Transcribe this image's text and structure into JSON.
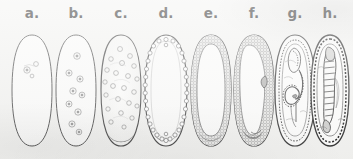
{
  "figure": {
    "background_color": "#f3f3f1",
    "ink_color": "#3a3a3a",
    "width": 353,
    "height": 159,
    "panel_count": 8
  },
  "panels": [
    {
      "label": "a.",
      "name": "panel-a",
      "stage": "fertilized egg / zygote",
      "x": 8,
      "width": 48,
      "nuclei_count": 3,
      "nuclei_layout": "few central nuclei near anterior",
      "has_pole_cells": false,
      "has_cell_layer": false,
      "has_furrow": false,
      "has_germ_band": false,
      "has_segments": false
    },
    {
      "label": "b.",
      "name": "panel-b",
      "stage": "early cleavage divisions",
      "x": 52,
      "width": 48,
      "nuclei_count": 9,
      "nuclei_layout": "scattered cleavage nuclei through yolk",
      "has_pole_cells": false,
      "has_cell_layer": false,
      "has_furrow": false,
      "has_germ_band": false,
      "has_segments": false
    },
    {
      "label": "c.",
      "name": "panel-c",
      "stage": "syncytial cleavage, nuclei migrating outward",
      "x": 96,
      "width": 50,
      "nuclei_count": 22,
      "nuclei_layout": "many nuclei spreading toward periphery",
      "has_pole_cells": true,
      "has_cell_layer": false,
      "has_furrow": false,
      "has_germ_band": false,
      "has_segments": false
    },
    {
      "label": "d.",
      "name": "panel-d",
      "stage": "syncytial blastoderm",
      "x": 140,
      "width": 52,
      "nuclei_count": 34,
      "nuclei_layout": "single peripheral ring of nuclei",
      "has_pole_cells": true,
      "has_cell_layer": false,
      "has_furrow": false,
      "has_germ_band": false,
      "has_segments": false
    },
    {
      "label": "e.",
      "name": "panel-e",
      "stage": "cellular blastoderm",
      "x": 186,
      "width": 50,
      "nuclei_count": 0,
      "nuclei_layout": "continuous cellularized epithelial band",
      "has_pole_cells": true,
      "has_cell_layer": true,
      "has_furrow": false,
      "has_germ_band": false,
      "has_segments": false
    },
    {
      "label": "f.",
      "name": "panel-f",
      "stage": "gastrulation, ventral furrow invagination",
      "x": 229,
      "width": 50,
      "nuclei_count": 0,
      "nuclei_layout": "thick cell layer with invaginating furrow",
      "has_pole_cells": true,
      "has_cell_layer": true,
      "has_furrow": true,
      "has_germ_band": false,
      "has_segments": false
    },
    {
      "label": "g.",
      "name": "panel-g",
      "stage": "germ band extension",
      "x": 270,
      "width": 50,
      "nuclei_count": 0,
      "nuclei_layout": "coiled extended germ band",
      "has_pole_cells": true,
      "has_cell_layer": true,
      "has_furrow": false,
      "has_germ_band": true,
      "has_segments": false
    },
    {
      "label": "h.",
      "name": "panel-h",
      "stage": "segmented germ band / retraction",
      "x": 307,
      "width": 46,
      "nuclei_count": 0,
      "nuclei_layout": "segmented embryo within chorion",
      "has_pole_cells": true,
      "has_cell_layer": true,
      "has_furrow": false,
      "has_germ_band": false,
      "has_segments": true
    }
  ]
}
